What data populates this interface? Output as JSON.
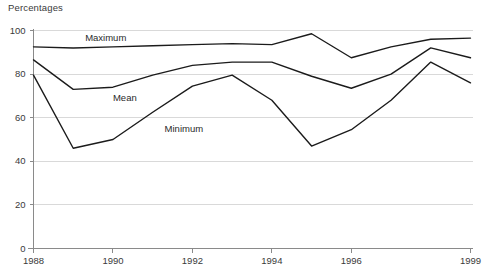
{
  "chart_data": {
    "type": "line",
    "title": "",
    "ylabel": "Percentages",
    "xlabel": "",
    "ylim": [
      0,
      100
    ],
    "xlim": [
      1988,
      1999
    ],
    "grid": true,
    "legend_position": "inline-labels",
    "yticks": [
      0,
      20,
      40,
      60,
      80,
      100
    ],
    "ytick_labels": [
      "0",
      "20",
      "40",
      "60",
      "80",
      "100"
    ],
    "xticks": [
      1988,
      1990,
      1992,
      1994,
      1996,
      1999
    ],
    "xtick_labels": [
      "1988",
      "1990",
      "1992",
      "1994",
      "1996",
      "1999"
    ],
    "x": [
      1988,
      1989,
      1990,
      1991,
      1992,
      1993,
      1994,
      1995,
      1996,
      1997,
      1998,
      1999
    ],
    "series": [
      {
        "name": "Maximum",
        "label_x": 1989.3,
        "label_y": 96.5,
        "values": [
          92.5,
          92.0,
          92.5,
          93.0,
          93.5,
          94.0,
          93.5,
          98.5,
          87.5,
          92.5,
          96.0,
          96.5
        ]
      },
      {
        "name": "Mean",
        "label_x": 1990.0,
        "label_y": 69.0,
        "values": [
          86.5,
          73.0,
          74.0,
          79.5,
          84.0,
          85.5,
          85.5,
          79.0,
          73.5,
          80.0,
          92.0,
          87.5
        ]
      },
      {
        "name": "Minimum",
        "label_x": 1991.3,
        "label_y": 55.0,
        "values": [
          79.5,
          46.0,
          50.0,
          62.5,
          74.5,
          79.5,
          68.0,
          47.0,
          54.5,
          68.0,
          85.5,
          76.0
        ]
      }
    ],
    "colors": {
      "line": "#1b1b1b",
      "grid": "#d9d9d9",
      "axis": "#8a8a8a",
      "text": "#3a3a3a"
    }
  }
}
